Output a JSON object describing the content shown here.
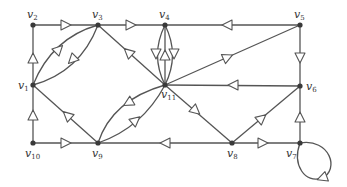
{
  "diagram": {
    "type": "directed-multigraph",
    "colors": {
      "edge": "#555555",
      "node": "#3a3a3a",
      "arrow_fill": "#ffffff",
      "label": "#333333"
    },
    "nodes": [
      {
        "id": "v1",
        "label": "v",
        "sub": "1",
        "x": 33,
        "y": 85,
        "lx": 18,
        "ly": 89
      },
      {
        "id": "v2",
        "label": "v",
        "sub": "2",
        "x": 33,
        "y": 25,
        "lx": 27,
        "ly": 18
      },
      {
        "id": "v3",
        "label": "v",
        "sub": "3",
        "x": 98,
        "y": 25,
        "lx": 92,
        "ly": 18
      },
      {
        "id": "v4",
        "label": "v",
        "sub": "4",
        "x": 165,
        "y": 25,
        "lx": 159,
        "ly": 18
      },
      {
        "id": "v5",
        "label": "v",
        "sub": "5",
        "x": 300,
        "y": 25,
        "lx": 294,
        "ly": 18
      },
      {
        "id": "v6",
        "label": "v",
        "sub": "6",
        "x": 300,
        "y": 86,
        "lx": 306,
        "ly": 90
      },
      {
        "id": "v7",
        "label": "v",
        "sub": "7",
        "x": 300,
        "y": 143,
        "lx": 286,
        "ly": 157
      },
      {
        "id": "v8",
        "label": "v",
        "sub": "8",
        "x": 232,
        "y": 143,
        "lx": 227,
        "ly": 157
      },
      {
        "id": "v9",
        "label": "v",
        "sub": "9",
        "x": 98,
        "y": 143,
        "lx": 92,
        "ly": 157
      },
      {
        "id": "v10",
        "label": "v",
        "sub": "10",
        "x": 33,
        "y": 143,
        "lx": 25,
        "ly": 157
      },
      {
        "id": "v11",
        "label": "v",
        "sub": "11",
        "x": 165,
        "y": 85,
        "lx": 161,
        "ly": 98
      }
    ],
    "edges": [
      {
        "from": "v1",
        "to": "v2",
        "path": "M33,85 L33,25",
        "arrow": [
          33,
          58,
          -90
        ]
      },
      {
        "from": "v2",
        "to": "v3",
        "path": "M33,25 L98,25",
        "arrow": [
          66,
          25,
          0
        ]
      },
      {
        "from": "v3",
        "to": "v4",
        "path": "M98,25 L165,25",
        "arrow": [
          131,
          25,
          0
        ]
      },
      {
        "from": "v5",
        "to": "v4",
        "path": "M300,25 L165,25",
        "arrow": [
          227,
          25,
          180
        ]
      },
      {
        "from": "v1",
        "to": "v3",
        "path": "M33,85 Q52,38 98,25",
        "arrow": [
          59,
          49,
          -45
        ]
      },
      {
        "from": "v3",
        "to": "v1",
        "path": "M98,25 Q80,72 33,85",
        "arrow": [
          72,
          60,
          135
        ]
      },
      {
        "from": "v11",
        "to": "v3",
        "path": "M165,85 L98,25",
        "arrow": [
          128,
          52,
          -138
        ]
      },
      {
        "from": "v4",
        "to": "v11",
        "path": "M165,25 Q150,55 165,85",
        "arrow": [
          156,
          54,
          90
        ]
      },
      {
        "from": "v11",
        "to": "v4",
        "path": "M165,85 L165,25",
        "arrow": [
          165,
          55,
          -90
        ]
      },
      {
        "from": "v4",
        "to": "v11",
        "path": "M165,25 Q180,55 165,85",
        "arrow": [
          174,
          54,
          90
        ]
      },
      {
        "from": "v11",
        "to": "v5",
        "path": "M165,85 L300,25",
        "arrow": [
          228,
          57,
          -24
        ]
      },
      {
        "from": "v5",
        "to": "v6",
        "path": "M300,25 L300,86",
        "arrow": [
          300,
          58,
          90
        ]
      },
      {
        "from": "v6",
        "to": "v11",
        "path": "M300,86 L165,85",
        "arrow": [
          233,
          85,
          180
        ]
      },
      {
        "from": "v11",
        "to": "v8",
        "path": "M165,85 L232,143",
        "arrow": [
          196,
          111,
          41
        ]
      },
      {
        "from": "v8",
        "to": "v6",
        "path": "M232,143 L300,86",
        "arrow": [
          262,
          118,
          -40
        ]
      },
      {
        "from": "v7",
        "to": "v6",
        "path": "M300,143 L300,86",
        "arrow": [
          300,
          117,
          -90
        ]
      },
      {
        "from": "v8",
        "to": "v7",
        "path": "M232,143 L300,143",
        "arrow": [
          263,
          143,
          0
        ]
      },
      {
        "from": "v8",
        "to": "v9",
        "path": "M232,143 L98,143",
        "arrow": [
          165,
          143,
          180
        ]
      },
      {
        "from": "v10",
        "to": "v9",
        "path": "M33,143 L98,143",
        "arrow": [
          66,
          143,
          0
        ]
      },
      {
        "from": "v10",
        "to": "v1",
        "path": "M33,143 L33,85",
        "arrow": [
          33,
          115,
          -90
        ]
      },
      {
        "from": "v9",
        "to": "v1",
        "path": "M98,143 L33,85",
        "arrow": [
          67,
          115,
          -138
        ]
      },
      {
        "from": "v11",
        "to": "v9",
        "path": "M165,85 Q112,100 98,143",
        "arrow": [
          128,
          103,
          150
        ]
      },
      {
        "from": "v9",
        "to": "v11",
        "path": "M98,143 Q142,128 165,85",
        "arrow": [
          136,
          120,
          -40
        ]
      },
      {
        "from": "v7",
        "to": "v7",
        "path": "M300,143 C330,138 340,170 322,178 C305,184 292,165 300,143",
        "arrow": [
          322,
          178,
          160
        ]
      }
    ]
  }
}
